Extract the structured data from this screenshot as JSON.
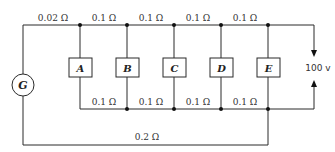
{
  "diagram": {
    "title": "",
    "generator": {
      "label": "G"
    },
    "loads": [
      {
        "label": "A"
      },
      {
        "label": "B"
      },
      {
        "label": "C"
      },
      {
        "label": "D"
      },
      {
        "label": "E"
      }
    ],
    "top_resistances": [
      "0.02 Ω",
      "0.1 Ω",
      "0.1 Ω",
      "0.1 Ω",
      "0.1 Ω"
    ],
    "bottom_resistances": [
      "0.1 Ω",
      "0.1 Ω",
      "0.1 Ω",
      "0.1 Ω"
    ],
    "return_resistance": "0.2 Ω",
    "supply_voltage": "100 v",
    "colors": {
      "line": "#2a2a2a",
      "background": "#ffffff"
    }
  }
}
